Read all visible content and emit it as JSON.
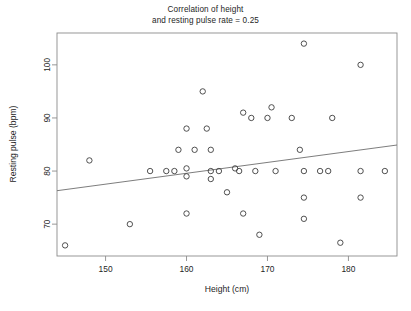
{
  "chart_data": {
    "type": "scatter",
    "title": "Correlation of height\nand resting pulse rate = 0.25",
    "xlabel": "Height (cm)",
    "ylabel": "Resting pulse (bpm)",
    "xlim": [
      144.0,
      186.0
    ],
    "ylim": [
      64.0,
      106.0
    ],
    "xticks": [
      150,
      160,
      170,
      180
    ],
    "yticks": [
      70,
      80,
      90,
      100
    ],
    "grid": false,
    "legend": null,
    "correlation": 0.25,
    "marker": "open-circle",
    "points": [
      {
        "x": 145.0,
        "y": 66.0
      },
      {
        "x": 148.0,
        "y": 82.0
      },
      {
        "x": 153.0,
        "y": 70.0
      },
      {
        "x": 155.5,
        "y": 80.0
      },
      {
        "x": 157.5,
        "y": 80.0
      },
      {
        "x": 158.5,
        "y": 80.0
      },
      {
        "x": 159.0,
        "y": 84.0
      },
      {
        "x": 160.0,
        "y": 88.0
      },
      {
        "x": 160.0,
        "y": 80.5
      },
      {
        "x": 160.0,
        "y": 79.0
      },
      {
        "x": 160.0,
        "y": 72.0
      },
      {
        "x": 161.0,
        "y": 84.0
      },
      {
        "x": 162.0,
        "y": 95.0
      },
      {
        "x": 162.5,
        "y": 88.0
      },
      {
        "x": 163.0,
        "y": 84.0
      },
      {
        "x": 163.0,
        "y": 80.0
      },
      {
        "x": 163.0,
        "y": 78.5
      },
      {
        "x": 164.0,
        "y": 80.0
      },
      {
        "x": 165.0,
        "y": 76.0
      },
      {
        "x": 166.0,
        "y": 80.5
      },
      {
        "x": 166.5,
        "y": 80.0
      },
      {
        "x": 167.0,
        "y": 91.0
      },
      {
        "x": 167.0,
        "y": 72.0
      },
      {
        "x": 168.0,
        "y": 90.0
      },
      {
        "x": 168.5,
        "y": 80.0
      },
      {
        "x": 169.0,
        "y": 68.0
      },
      {
        "x": 170.0,
        "y": 90.0
      },
      {
        "x": 170.5,
        "y": 92.0
      },
      {
        "x": 171.0,
        "y": 80.0
      },
      {
        "x": 173.0,
        "y": 90.0
      },
      {
        "x": 174.0,
        "y": 84.0
      },
      {
        "x": 174.5,
        "y": 104.0
      },
      {
        "x": 174.5,
        "y": 80.0
      },
      {
        "x": 174.5,
        "y": 75.0
      },
      {
        "x": 174.5,
        "y": 71.0
      },
      {
        "x": 176.5,
        "y": 80.0
      },
      {
        "x": 177.5,
        "y": 80.0
      },
      {
        "x": 178.0,
        "y": 90.0
      },
      {
        "x": 179.0,
        "y": 66.5
      },
      {
        "x": 181.5,
        "y": 80.0
      },
      {
        "x": 181.5,
        "y": 75.0
      },
      {
        "x": 181.5,
        "y": 100.0
      },
      {
        "x": 184.5,
        "y": 80.0
      }
    ],
    "trend_line": {
      "x_start": 144.0,
      "y_start": 76.3,
      "x_end": 186.0,
      "y_end": 84.9
    }
  }
}
